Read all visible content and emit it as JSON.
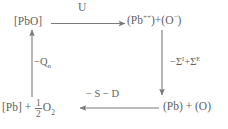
{
  "diagram": {
    "type": "thermochemical-cycle",
    "stroke_color": "#7a7a7a",
    "text_color": "#5f5f5f",
    "background_color": "#ffffff",
    "nodes": {
      "top_left": {
        "id": "node-pbo",
        "text": "[PbO]",
        "description": "solid lead oxide"
      },
      "top_right": {
        "id": "node-ions",
        "prefix": "(Pb",
        "cation_charge": "++",
        "middle": ")+(O",
        "anion_charge": "−",
        "suffix": ")",
        "text": "(Pb++)+(O−)",
        "description": "gaseous lead cation plus oxygen anion"
      },
      "bottom_left": {
        "id": "node-pb-oxygen",
        "lead": "[Pb]",
        "plus": "+",
        "fraction_numerator": "1",
        "fraction_denominator": "2",
        "oxygen": "O",
        "oxygen_subscript": "2",
        "text": "[Pb] + 1/2 O2",
        "description": "solid lead plus half mole of dioxygen"
      },
      "bottom_right": {
        "id": "node-atoms",
        "text": "(Pb) + (O)",
        "description": "gaseous lead atom plus oxygen atom"
      }
    },
    "edges": [
      {
        "id": "edge-top",
        "from": "top_left",
        "to": "top_right",
        "direction": "right",
        "label": "U",
        "label_id": "label-u",
        "description": "lattice energy"
      },
      {
        "id": "edge-right",
        "from": "top_right",
        "to": "bottom_right",
        "direction": "down",
        "label": "−ΣI+ΣE",
        "label_parts": {
          "minus": "−",
          "sigma1": "Σ",
          "sup1": "I",
          "plus": "+",
          "sigma2": "Σ",
          "sup2": "E"
        },
        "label_id": "label-sigma",
        "description": "negative sum of ionization energies plus sum of electron affinities"
      },
      {
        "id": "edge-bottom",
        "from": "bottom_right",
        "to": "bottom_left",
        "direction": "left",
        "label": "− S − D",
        "label_id": "label-sd",
        "description": "negative sublimation energy minus dissociation energy"
      },
      {
        "id": "edge-left",
        "from": "bottom_left",
        "to": "top_left",
        "direction": "up",
        "label": "−Qn",
        "label_parts": {
          "minus": "−",
          "symbol": "Q",
          "subscript": "n"
        },
        "label_id": "label-qn",
        "description": "negative heat of formation"
      }
    ]
  }
}
